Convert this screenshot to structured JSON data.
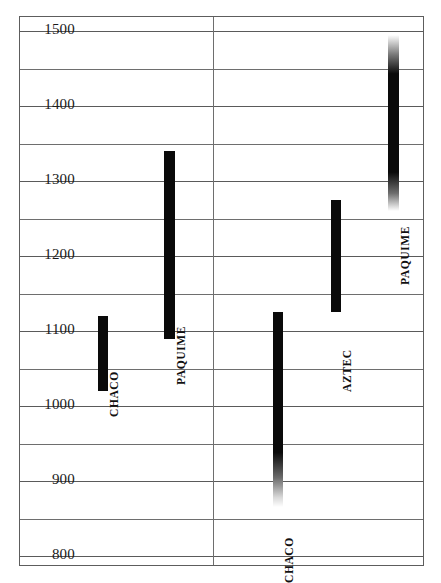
{
  "chart_data": {
    "type": "bar",
    "orientation": "vertical-range",
    "title": "",
    "subtitle": "",
    "xlabel": "",
    "ylabel": "",
    "ylim": [
      800,
      1500
    ],
    "y_tick_labels": [
      "1500",
      "1400",
      "1300",
      "1200",
      "1100",
      "1000",
      "900",
      "800"
    ],
    "y_tick_values": [
      1500,
      1400,
      1300,
      1200,
      1100,
      1000,
      900,
      800
    ],
    "gridline_values": [
      1500,
      1450,
      1400,
      1350,
      1300,
      1250,
      1200,
      1150,
      1100,
      1050,
      1000,
      950,
      900,
      850,
      800
    ],
    "grid": true,
    "legend": "none",
    "divider_note": "vertical line splitting plot into two halves",
    "series": [
      {
        "name": "CHACO",
        "label": "CHACO",
        "start": 1020,
        "end": 1120,
        "fade_top": false,
        "fade_bottom": false
      },
      {
        "name": "PAQUIME",
        "label": "PAQUIME",
        "start": 1090,
        "end": 1340,
        "fade_top": false,
        "fade_bottom": false
      },
      {
        "name": "CHACO",
        "label": "CHACO",
        "start": 865,
        "end": 1125,
        "fade_top": false,
        "fade_bottom": true
      },
      {
        "name": "AZTEC",
        "label": "AZTEC",
        "start": 1125,
        "end": 1275,
        "fade_top": false,
        "fade_bottom": false
      },
      {
        "name": "PAQUIME",
        "label": "PAQUIME",
        "start": 1260,
        "end": 1495,
        "fade_top": true,
        "fade_bottom": true
      }
    ],
    "colors": {
      "bar": "#0a0a0a",
      "grid": "#6e6e6e",
      "frame": "#5d5d5d",
      "text": "#1a1a1a",
      "background": "#ffffff"
    }
  }
}
